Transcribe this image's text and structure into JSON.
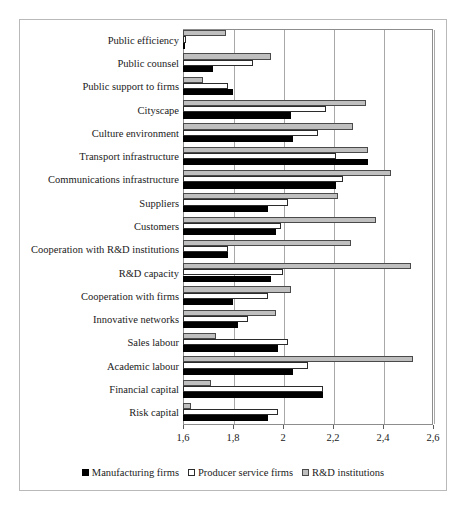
{
  "chart_data": {
    "type": "bar",
    "orientation": "horizontal",
    "title": "",
    "xlabel": "",
    "ylabel": "",
    "xlim": [
      1.6,
      2.6
    ],
    "decimal_separator": ",",
    "grid": true,
    "legend_position": "bottom",
    "tick_labels": [
      "1,6",
      "1,8",
      "2",
      "2,2",
      "2,4",
      "2,6"
    ],
    "ticks": [
      1.6,
      1.8,
      2.0,
      2.2,
      2.4,
      2.6
    ],
    "categories": [
      "Public efficiency",
      "Public counsel",
      "Public support to firms",
      "Cityscape",
      "Culture environment",
      "Transport infrastructure",
      "Communications infrastructure",
      "Suppliers",
      "Customers",
      "Cooperation with R&D institutions",
      "R&D capacity",
      "Cooperation with firms",
      "Innovative networks",
      "Sales labour",
      "Academic labour",
      "Financial capital",
      "Risk capital"
    ],
    "series": [
      {
        "name": "Manufacturing firms",
        "color": "#000000",
        "values": [
          1.6,
          1.72,
          1.8,
          2.03,
          2.04,
          2.34,
          2.21,
          1.94,
          1.97,
          1.78,
          1.95,
          1.8,
          1.82,
          1.98,
          2.04,
          2.16,
          1.94
        ]
      },
      {
        "name": "Producer service firms",
        "color": "#ffffff",
        "values": [
          1.61,
          1.88,
          1.78,
          2.17,
          2.14,
          2.21,
          2.24,
          2.02,
          1.99,
          1.78,
          2.0,
          1.94,
          1.86,
          2.02,
          2.1,
          2.16,
          1.98
        ]
      },
      {
        "name": "R&D institutions",
        "color": "#bfbfbf",
        "values": [
          1.77,
          1.95,
          1.68,
          2.33,
          2.28,
          2.34,
          2.43,
          2.22,
          2.37,
          2.27,
          2.51,
          2.03,
          1.97,
          1.73,
          2.52,
          1.71,
          1.63
        ]
      }
    ]
  }
}
